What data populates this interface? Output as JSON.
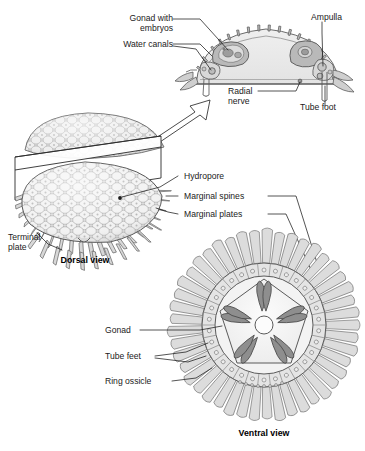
{
  "figure": {
    "background_color": "#ffffff",
    "ink_color": "#1b1b1b",
    "line_color": "#4a4a4a",
    "fill_light": "#e9e9e9",
    "fill_mid": "#c9c9c9",
    "fill_dark": "#8e8e8e",
    "fill_body": "#efefef"
  },
  "cross_section": {
    "name": "cross-sectional view through arm/disc",
    "labels": {
      "gonad": "Gonad with\nembryos",
      "water_canals": "Water canals",
      "ampulla": "Ampulla",
      "radial_nerve": "Radial\nnerve",
      "tube_foot": "Tube foot"
    }
  },
  "dorsal_view": {
    "caption": "Dorsal view",
    "labels": {
      "hydropore": "Hydropore",
      "marginal_spines": "Marginal spines",
      "marginal_plates": "Marginal plates",
      "terminal_plate": "Terminal\nplate"
    }
  },
  "ventral_view": {
    "caption": "Ventral view",
    "labels": {
      "gonad": "Gonad",
      "tube_feet": "Tube feet",
      "ring_ossicle": "Ring ossicle"
    },
    "symmetry": "pentaradial (5-fold)",
    "gonad_pairs": 5,
    "central_ring": "mouth / central disc opening"
  }
}
